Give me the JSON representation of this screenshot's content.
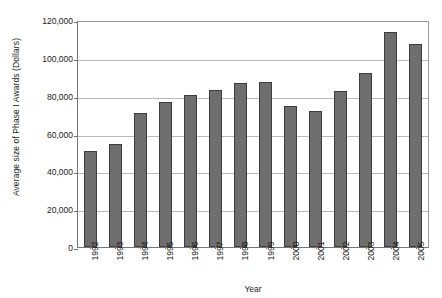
{
  "chart_data": {
    "type": "bar",
    "title": "",
    "xlabel": "Year",
    "ylabel": "Average size of Phase I Awards (Dollars)",
    "categories": [
      "1992",
      "1993",
      "1994",
      "1995",
      "1996",
      "1997",
      "1998",
      "1999",
      "2000",
      "2001",
      "2002",
      "2003",
      "2004",
      "2005"
    ],
    "values": [
      50700,
      54500,
      71000,
      76500,
      80400,
      83000,
      86500,
      87000,
      74500,
      71800,
      82300,
      91800,
      113800,
      107200
    ],
    "series": [
      {
        "name": "Average size of Phase I Awards",
        "values": [
          50700,
          54500,
          71000,
          76500,
          80400,
          83000,
          86500,
          87000,
          74500,
          71800,
          82300,
          91800,
          113800,
          107200
        ]
      }
    ],
    "ylim": [
      0,
      120000
    ],
    "y_ticks": [
      0,
      20000,
      40000,
      60000,
      80000,
      100000,
      120000
    ],
    "y_tick_labels": [
      "0",
      "20,000",
      "40,000",
      "60,000",
      "80,000",
      "100,000",
      "120,000"
    ],
    "grid": true,
    "grid_axis": "y",
    "legend": false,
    "legend_position": "none",
    "bar_color": "#6e6e6e",
    "bar_border_color": "#3d3d3d",
    "gridline_color": "#b9b9b9",
    "axis_color": "#777777",
    "background_color": "#ffffff",
    "x_tick_label_rotation": -90
  }
}
